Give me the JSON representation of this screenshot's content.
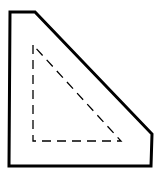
{
  "diagram": {
    "outer_shape": {
      "points": "10,12 35,12 152,134 151,166 9,166",
      "stroke": "#000000",
      "stroke_width": 3,
      "style": "solid"
    },
    "inner_shape": {
      "points": "33,45 33,141 121,141",
      "stroke": "#000000",
      "stroke_width": 1.3,
      "style": "dashed",
      "dash": "9,6"
    },
    "background": "#ffffff"
  }
}
